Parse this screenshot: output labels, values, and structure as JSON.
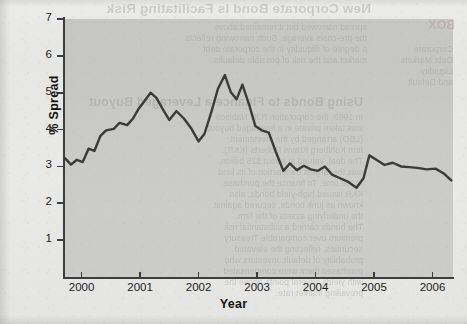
{
  "chart_data": {
    "type": "line",
    "title": "",
    "xlabel": "Year",
    "ylabel": "% Spread",
    "xlim": [
      1999.7,
      2006.35
    ],
    "ylim": [
      0,
      7
    ],
    "grid": false,
    "legend": "none",
    "x_ticks": [
      "2000",
      "2001",
      "2002",
      "2003",
      "2004",
      "2005",
      "2006"
    ],
    "y_ticks": [
      "1",
      "2",
      "3",
      "4",
      "5",
      "6",
      "7"
    ],
    "series": [
      {
        "name": "% Spread",
        "color": "#3a3a3a",
        "x": [
          1999.72,
          1999.82,
          1999.92,
          2000.02,
          2000.12,
          2000.22,
          2000.32,
          2000.42,
          2000.55,
          2000.65,
          2000.78,
          2000.88,
          2000.97,
          2001.08,
          2001.18,
          2001.28,
          2001.4,
          2001.5,
          2001.62,
          2001.75,
          2001.88,
          2002.0,
          2002.1,
          2002.22,
          2002.33,
          2002.45,
          2002.55,
          2002.65,
          2002.75,
          2002.86,
          2002.97,
          2003.08,
          2003.2,
          2003.32,
          2003.45,
          2003.56,
          2003.68,
          2003.8,
          2003.92,
          2004.04,
          2004.16,
          2004.28,
          2004.42,
          2004.56,
          2004.7,
          2004.82,
          2004.92,
          2005.04,
          2005.18,
          2005.32,
          2005.46,
          2005.6,
          2005.74,
          2005.9,
          2006.05,
          2006.2,
          2006.32
        ],
        "y": [
          3.22,
          3.05,
          3.18,
          3.12,
          3.48,
          3.42,
          3.82,
          3.98,
          4.02,
          4.18,
          4.12,
          4.3,
          4.55,
          4.78,
          5.0,
          4.86,
          4.52,
          4.26,
          4.5,
          4.3,
          4.02,
          3.68,
          3.88,
          4.48,
          5.1,
          5.48,
          5.02,
          4.82,
          5.22,
          4.7,
          4.1,
          3.98,
          3.92,
          3.4,
          2.88,
          3.08,
          2.9,
          3.02,
          2.92,
          2.88,
          3.0,
          2.78,
          2.68,
          2.58,
          2.42,
          2.68,
          3.3,
          3.18,
          3.04,
          3.1,
          3.0,
          2.98,
          2.96,
          2.92,
          2.94,
          2.8,
          2.62
        ]
      }
    ]
  },
  "bleed_through": {
    "heading_top": "New Corporate Bond Is Facilitating Risk",
    "heading_badge": "BOX",
    "heading_mid": "Using Bonds to Finance a Leveraged Buyout",
    "column_left": [
      "spread narrowed but it remained above",
      "the pre-crisis average. Such narrowing reflects",
      "a degree of illiquidity in the corporate debt",
      "market and the risk of possible defaults."
    ],
    "column_body": [
      "In 1989, the corporation RJR Nabisco",
      "was taken private in a leveraged buyout",
      "(LBO) arranged by the investment",
      "firm Kohlberg Kravis Roberts (KKR).",
      "The deal, valued at about $25 billion,",
      "was the largest transaction of its kind",
      "at the time. To finance the purchase,",
      "KKR issued high-yield bonds, also",
      "known as junk bonds, secured against",
      "the underlying assets of the firm.",
      "The bonds carried a substantial risk",
      "premium over comparable Treasury",
      "securities, reflecting the elevated",
      "probability of default. Investors who",
      "purchased them were compensated",
      "with yields several points above the",
      "prevailing market rate."
    ],
    "sidebar": [
      "Corporate",
      "Debt Markets",
      "Liquidity",
      "and Default"
    ]
  }
}
